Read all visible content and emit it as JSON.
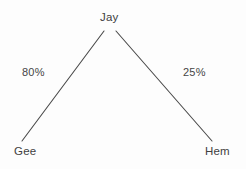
{
  "diagram": {
    "type": "tree",
    "background_color": "#fdfdfd",
    "stroke_color": "#4a4a4a",
    "text_color": "#414141",
    "nodes": [
      {
        "id": "root",
        "label": "Jay",
        "x": 111,
        "y": 18
      },
      {
        "id": "left",
        "label": "Gee",
        "x": 26,
        "y": 152
      },
      {
        "id": "right",
        "label": "Hem",
        "x": 218,
        "y": 152
      }
    ],
    "edges": [
      {
        "id": "edge-jay-gee",
        "from": "Jay",
        "to": "Gee",
        "label": "80%",
        "x1": 104,
        "y1": 31,
        "x2": 22,
        "y2": 141
      },
      {
        "id": "edge-jay-hem",
        "from": "Jay",
        "to": "Hem",
        "label": "25%",
        "x1": 116,
        "y1": 31,
        "x2": 212,
        "y2": 141
      }
    ]
  }
}
